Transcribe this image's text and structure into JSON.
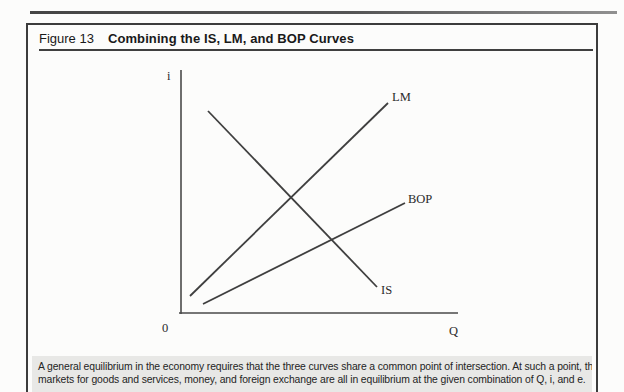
{
  "figure_header": {
    "label": "Figure 13",
    "title": "Combining the IS, LM, and BOP Curves"
  },
  "chart_data": {
    "type": "line",
    "title": "Combining the IS, LM, and BOP Curves",
    "xlabel": "Q",
    "ylabel": "i",
    "origin_label": "0",
    "axis_numeric": false,
    "grid": false,
    "legend": "none (curves labeled inline)",
    "axes_px": {
      "y_axis": {
        "x1": 181,
        "y1": 70,
        "x2": 181,
        "y2": 314
      },
      "x_axis": {
        "x1": 179,
        "y1": 313,
        "x2": 458,
        "y2": 313
      }
    },
    "label_positions": {
      "i": {
        "x": 167,
        "y": 80
      },
      "origin": {
        "x": 162,
        "y": 332
      },
      "q": {
        "x": 449,
        "y": 335
      }
    },
    "series": [
      {
        "name": "IS",
        "direction": "downward-sloping",
        "px": {
          "x1": 208,
          "y1": 111,
          "x2": 377,
          "y2": 287
        },
        "label": {
          "text": "IS",
          "x": 381,
          "y": 294
        }
      },
      {
        "name": "LM",
        "direction": "upward-sloping",
        "px": {
          "x1": 190,
          "y1": 296,
          "x2": 388,
          "y2": 103
        },
        "label": {
          "text": "LM",
          "x": 392,
          "y": 101
        }
      },
      {
        "name": "BOP",
        "direction": "upward-sloping (flatter)",
        "px": {
          "x1": 203,
          "y1": 304,
          "x2": 405,
          "y2": 203
        },
        "label": {
          "text": "BOP",
          "x": 408,
          "y": 203
        }
      }
    ],
    "intersections_px": [
      {
        "curves": "IS-LM",
        "x": 292,
        "y": 200
      },
      {
        "curves": "IS-BOP",
        "x": 331,
        "y": 239
      }
    ]
  },
  "caption": {
    "line1": "A general equilibrium in the economy requires that the three curves share a common point of intersection. At such a point, the",
    "line2": "markets for goods and services, money, and foreign exchange are all in equilibrium at the given combination of Q, i, and e."
  },
  "colors": {
    "curve": "#3f3f3f",
    "axis": "#4a4a4a",
    "box_border": "#3c3c3c",
    "caption_background": "#e8e8e6",
    "page_background": "#fcfcfb"
  }
}
